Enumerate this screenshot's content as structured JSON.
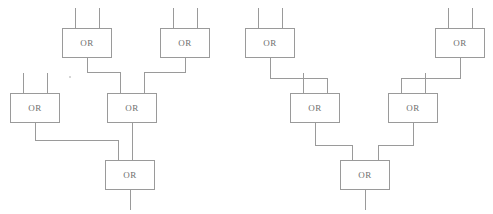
{
  "diagram": {
    "gate_label": "OR",
    "wire_color": "#9a9a9a",
    "box_border_color": "#9a9a9a",
    "label_color": "#6e6e6e",
    "background_color": "#ffffff",
    "gate_count": 10,
    "gates": [
      {
        "id": "left-top-1",
        "label": "OR",
        "x": 62,
        "y": 28,
        "w": 50,
        "h": 30
      },
      {
        "id": "left-top-2",
        "label": "OR",
        "x": 160,
        "y": 28,
        "w": 50,
        "h": 30
      },
      {
        "id": "left-mid-1",
        "label": "OR",
        "x": 10,
        "y": 93,
        "w": 50,
        "h": 30
      },
      {
        "id": "left-mid-2",
        "label": "OR",
        "x": 107,
        "y": 93,
        "w": 50,
        "h": 30
      },
      {
        "id": "left-out",
        "label": "OR",
        "x": 105,
        "y": 160,
        "w": 50,
        "h": 30
      },
      {
        "id": "right-top-1",
        "label": "OR",
        "x": 245,
        "y": 28,
        "w": 50,
        "h": 30
      },
      {
        "id": "right-top-2",
        "label": "OR",
        "x": 435,
        "y": 28,
        "w": 50,
        "h": 30
      },
      {
        "id": "right-mid-1",
        "label": "OR",
        "x": 290,
        "y": 93,
        "w": 50,
        "h": 30
      },
      {
        "id": "right-mid-2",
        "label": "OR",
        "x": 388,
        "y": 93,
        "w": 50,
        "h": 30
      },
      {
        "id": "right-out",
        "label": "OR",
        "x": 340,
        "y": 160,
        "w": 50,
        "h": 30
      }
    ],
    "wires": [
      "M75,8 L75,28",
      "M99,8 L99,28",
      "M173,8 L173,28",
      "M197,8 L197,28",
      "M23,73 L23,93",
      "M47,73 L47,93",
      "M87,58 L87,72 L120,72 L120,93",
      "M185,58 L185,72 L144,72 L144,93",
      "M132,123 L132,160",
      "M35,123 L35,140 L118,140 L118,160",
      "M130,190 L130,210",
      "M258,8 L258,28",
      "M282,8 L282,28",
      "M448,8 L448,28",
      "M472,8 L472,28",
      "M303,73 L303,93",
      "M425,73 L425,93",
      "M270,58 L270,78 L327,78 L327,93",
      "M460,58 L460,78 L401,78 L401,93",
      "M315,123 L315,145 L352,145 L352,160",
      "M413,123 L413,145 L378,145 L378,160",
      "M365,190 L365,210"
    ],
    "specks": [
      {
        "x": 69,
        "y": 76
      }
    ]
  }
}
